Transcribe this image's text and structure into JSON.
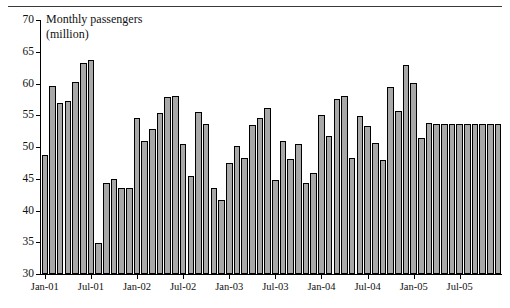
{
  "figure": {
    "title": "Monthly passengers\n(million)",
    "bar_fill": "#a8a8a8",
    "bar_stroke": "#000000",
    "top_rule_color": "#3a3a3a"
  },
  "chart_data": {
    "type": "bar",
    "title": "Monthly passengers (million)",
    "xlabel": "",
    "ylabel": "Monthly passengers (million)",
    "ylim": [
      30,
      70
    ],
    "ytick_labels": [
      "30",
      "35",
      "40",
      "45",
      "50",
      "55",
      "60",
      "65",
      "70"
    ],
    "yticks": [
      30,
      35,
      40,
      45,
      50,
      55,
      60,
      65,
      70
    ],
    "grid": false,
    "legend": "none",
    "xtick_labels": [
      "Jan-01",
      "Jul-01",
      "Jan-02",
      "Jul-02",
      "Jan-03",
      "Jul-03",
      "Jan-04",
      "Jul-04",
      "Jan-05",
      "Jul-05"
    ],
    "xtick_indices": [
      0,
      6,
      12,
      18,
      24,
      30,
      36,
      42,
      48,
      54
    ],
    "categories": [
      "Jan-01",
      "Feb-01",
      "Mar-01",
      "Apr-01",
      "May-01",
      "Jun-01",
      "Jul-01",
      "Aug-01",
      "Sep-01",
      "Oct-01",
      "Nov-01",
      "Dec-01",
      "Jan-02",
      "Feb-02",
      "Mar-02",
      "Apr-02",
      "May-02",
      "Jun-02",
      "Jul-02",
      "Aug-02",
      "Sep-02",
      "Oct-02",
      "Nov-02",
      "Dec-02",
      "Jan-03",
      "Feb-03",
      "Mar-03",
      "Apr-03",
      "May-03",
      "Jun-03",
      "Jul-03",
      "Aug-03",
      "Sep-03",
      "Oct-03",
      "Nov-03",
      "Dec-03",
      "Jan-04",
      "Feb-04",
      "Mar-04",
      "Apr-04",
      "May-04",
      "Jun-04",
      "Jul-04",
      "Aug-04",
      "Sep-04",
      "Oct-04",
      "Nov-04",
      "Dec-04",
      "Jan-05",
      "Feb-05",
      "Mar-05",
      "Apr-05",
      "May-05",
      "Jun-05",
      "Jul-05",
      "Aug-05",
      "Sep-05",
      "Oct-05",
      "Nov-05",
      "Dec-05"
    ],
    "values": [
      48.7,
      59.6,
      57.0,
      57.3,
      60.3,
      63.2,
      63.7,
      34.9,
      44.3,
      45.0,
      43.6,
      43.5,
      54.6,
      50.9,
      52.8,
      55.4,
      57.9,
      58.0,
      50.4,
      45.5,
      55.5,
      53.6,
      43.6,
      41.7,
      47.5,
      50.2,
      48.2,
      53.5,
      54.5,
      56.2,
      44.8,
      50.9,
      48.1,
      50.5,
      44.4,
      45.9,
      55.0,
      51.8,
      57.6,
      58.0,
      48.2,
      54.9,
      53.3,
      50.6,
      47.9,
      59.5,
      55.6,
      62.9,
      60.1,
      51.4,
      53.8,
      53.6,
      53.6,
      53.7,
      53.7,
      53.7,
      53.7,
      53.7,
      53.7,
      53.7
    ]
  }
}
